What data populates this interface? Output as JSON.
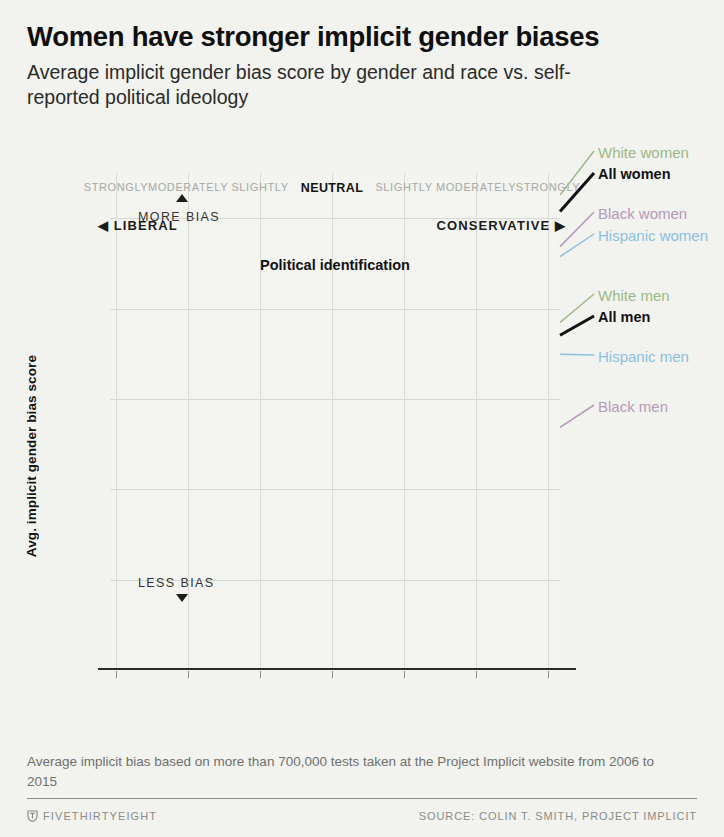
{
  "header": {
    "title": "Women have stronger implicit gender biases",
    "subtitle": "Average implicit gender bias score by gender and race vs. self-reported political ideology"
  },
  "annotations": {
    "more_bias": "MORE BIAS",
    "less_bias": "LESS BIAS",
    "more_bias_icon": "triangle-up-icon",
    "less_bias_icon": "triangle-down-icon",
    "liberal": "◀ LIBERAL",
    "conservative": "CONSERVATIVE ▶"
  },
  "footer": {
    "note": "Average implicit bias based on more than 700,000 tests taken at the Project Implicit website from 2006 to 2015",
    "brand": "FIVETHIRTYEIGHT",
    "brand_icon": "fivethirtyeight-logo-icon",
    "source": "SOURCE: COLIN T. SMITH, PROJECT IMPLICIT"
  },
  "chart_data": {
    "type": "line",
    "title": "Women have stronger implicit gender biases",
    "subtitle": "Average implicit gender bias score by gender and race vs. self-reported political ideology",
    "xlabel": "Political identification",
    "ylabel": "Avg. implicit gender bias score",
    "ylim": [
      0.0,
      0.55
    ],
    "yticks": [
      0.0,
      0.1,
      0.2,
      0.3,
      0.4,
      0.5
    ],
    "ytick_labels": [
      "0.0",
      "0.1",
      "0.2",
      "0.3",
      "0.4",
      "0.5"
    ],
    "grid": true,
    "legend_position": "right-inline",
    "categories": [
      "STRONGLY",
      "MODERATELY",
      "SLIGHTLY",
      "NEUTRAL",
      "SLIGHTLY",
      "MODERATELY",
      "STRONGLY"
    ],
    "series": [
      {
        "name": "White women",
        "color": "#9db887",
        "width": 1.6,
        "values": [
          0.36,
          0.406,
          0.424,
          0.414,
          0.444,
          0.47,
          0.489
        ]
      },
      {
        "name": "All women",
        "color": "#111111",
        "width": 3.4,
        "values": [
          0.368,
          0.401,
          0.418,
          0.407,
          0.437,
          0.468,
          0.471
        ]
      },
      {
        "name": "Black women",
        "color": "#b49ab8",
        "width": 1.6,
        "values": [
          0.452,
          0.462,
          0.465,
          0.452,
          0.468,
          0.474,
          0.432
        ]
      },
      {
        "name": "Hispanic women",
        "color": "#8bc0de",
        "width": 1.6,
        "values": [
          0.332,
          0.378,
          0.396,
          0.393,
          0.405,
          0.43,
          0.421
        ]
      },
      {
        "name": "White men",
        "color": "#9db887",
        "width": 1.6,
        "values": [
          0.345,
          0.348,
          0.348,
          0.306,
          0.355,
          0.357,
          0.348
        ]
      },
      {
        "name": "All men",
        "color": "#111111",
        "width": 3.4,
        "values": [
          0.329,
          0.342,
          0.344,
          0.295,
          0.348,
          0.349,
          0.334
        ]
      },
      {
        "name": "Hispanic men",
        "color": "#8bc0de",
        "width": 1.6,
        "values": [
          0.302,
          0.33,
          0.338,
          0.274,
          0.34,
          0.344,
          0.313
        ]
      },
      {
        "name": "Black men",
        "color": "#b49ab8",
        "width": 1.6,
        "values": [
          0.344,
          0.345,
          0.345,
          0.285,
          0.333,
          0.318,
          0.232
        ]
      }
    ],
    "legend_labels": [
      {
        "name": "White women",
        "color": "#9db887",
        "bold": false
      },
      {
        "name": "All women",
        "color": "#111111",
        "bold": true
      },
      {
        "name": "Black women",
        "color": "#b49ab8",
        "bold": false
      },
      {
        "name": "Hispanic women",
        "color": "#8bc0de",
        "bold": false
      },
      {
        "name": "White men",
        "color": "#9db887",
        "bold": false
      },
      {
        "name": "All men",
        "color": "#111111",
        "bold": true
      },
      {
        "name": "Hispanic men",
        "color": "#8bc0de",
        "bold": false
      },
      {
        "name": "Black men",
        "color": "#b49ab8",
        "bold": false
      }
    ]
  }
}
